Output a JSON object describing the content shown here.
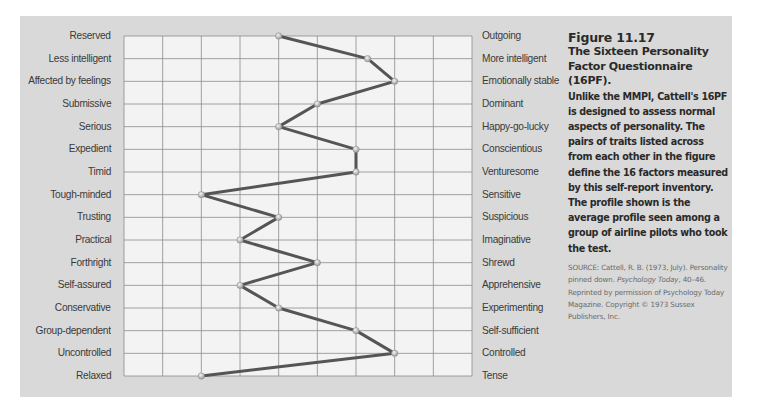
{
  "chart_data": {
    "type": "line",
    "title": "The Sixteen Personality Factor Questionnaire (16PF)",
    "orientation": "horizontal-profile",
    "left_labels": [
      "Reserved",
      "Less intelligent",
      "Affected by feelings",
      "Submissive",
      "Serious",
      "Expedient",
      "Timid",
      "Tough-minded",
      "Trusting",
      "Practical",
      "Forthright",
      "Self-assured",
      "Conservative",
      "Group-dependent",
      "Uncontrolled",
      "Relaxed"
    ],
    "right_labels": [
      "Outgoing",
      "More intelligent",
      "Emotionally stable",
      "Dominant",
      "Happy-go-lucky",
      "Conscientious",
      "Venturesome",
      "Sensitive",
      "Suspicious",
      "Imaginative",
      "Shrewd",
      "Apprehensive",
      "Experimenting",
      "Self-sufficient",
      "Controlled",
      "Tense"
    ],
    "values": [
      4,
      6.3,
      7,
      5,
      4,
      6,
      6,
      2,
      4,
      3,
      5,
      3,
      4,
      6,
      7,
      2
    ],
    "xlim": [
      0,
      9
    ],
    "grid": true,
    "grid_columns": 9,
    "xlabel": "",
    "ylabel": "",
    "legend": null,
    "colors": {
      "panel": "#d9d9d9",
      "grid_bg": "#f3f3f3",
      "grid_line": "#8c8c8c",
      "profile_line": "#555555",
      "marker": "#c8c8c8"
    }
  },
  "caption": {
    "figure_number": "Figure 11.17",
    "title": "The Sixteen Personality Factor Questionnaire (16PF).",
    "body": "Unlike the MMPI, Cattell's 16PF is designed to assess normal aspects of personality. The pairs of traits listed across from each other in the figure define the 16 factors measured by this self-report inventory. The profile shown is the average profile seen among a group of airline pilots who took the test.",
    "source_prefix": "SOURCE: Cattell, R. B. (1973, July). Personality pinned down. ",
    "source_journal": "Psychology Today",
    "source_suffix": ", 40–46. Reprinted by permission of Psychology Today Magazine. Copyright © 1973 Sussex Publishers, Inc."
  }
}
